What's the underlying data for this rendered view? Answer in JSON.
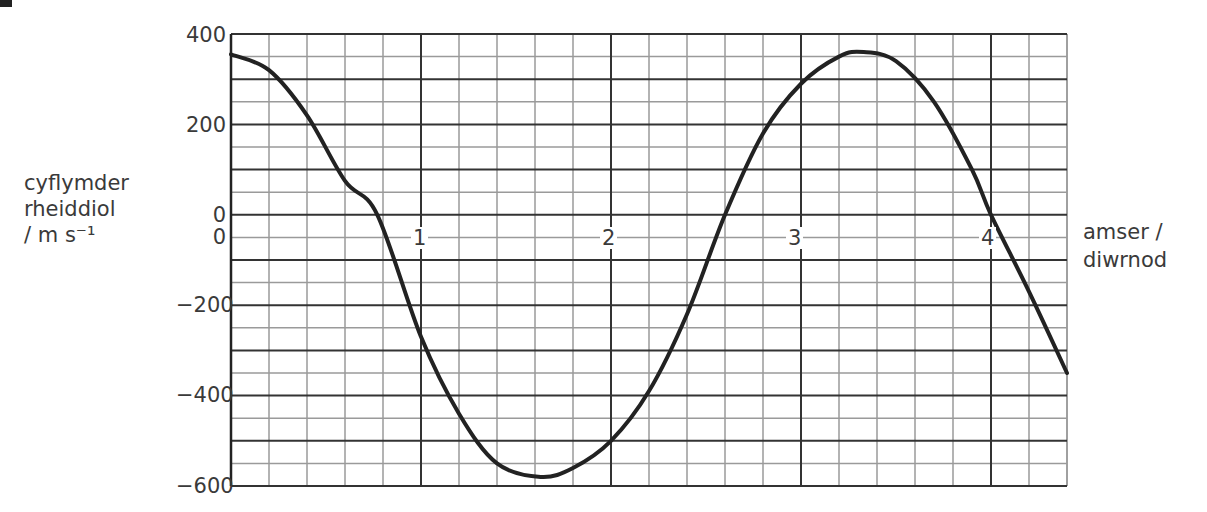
{
  "axis": {
    "y_label_lines": [
      "cyflymder",
      "rheiddiol",
      "/ m s⁻¹"
    ],
    "x_label_lines": [
      "amser /",
      "diwrnod"
    ],
    "y_ticks": [
      "400",
      "200",
      "0",
      "−200",
      "−400",
      "−600"
    ],
    "x_origin_label": "0",
    "x_ticks": [
      "1",
      "2",
      "3",
      "4"
    ]
  },
  "chart_data": {
    "type": "line",
    "title": "",
    "xlabel": "amser / diwrnod",
    "ylabel": "cyflymder rheiddiol / m s⁻¹",
    "xlim": [
      0,
      4.4
    ],
    "ylim": [
      -600,
      400
    ],
    "x_ticks": [
      0,
      1,
      2,
      3,
      4
    ],
    "y_ticks": [
      400,
      200,
      0,
      -200,
      -400,
      -600
    ],
    "grid": true,
    "grid_minor_x": 0.2,
    "grid_minor_y": 50,
    "series": [
      {
        "name": "radial velocity",
        "x": [
          0,
          0.2,
          0.4,
          0.6,
          0.77,
          1.0,
          1.2,
          1.4,
          1.63,
          1.8,
          2.0,
          2.2,
          2.4,
          2.6,
          2.8,
          3.0,
          3.2,
          3.33,
          3.5,
          3.7,
          3.9,
          4.0,
          4.2,
          4.4
        ],
        "values": [
          355,
          320,
          220,
          75,
          0,
          -270,
          -440,
          -550,
          -580,
          -560,
          -500,
          -390,
          -220,
          0,
          180,
          290,
          350,
          360,
          340,
          250,
          100,
          0,
          -170,
          -350
        ]
      }
    ]
  },
  "colors": {
    "curve": "#222222",
    "major_grid": "#333333",
    "minor_grid": "#9a9a9a"
  }
}
